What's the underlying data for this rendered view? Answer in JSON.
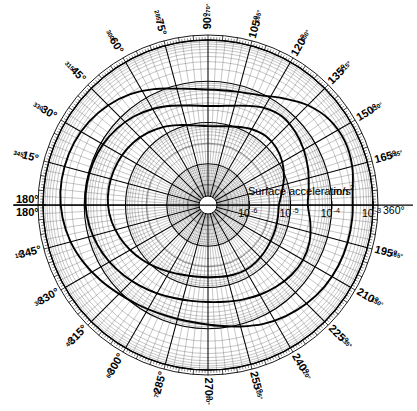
{
  "figure": {
    "kind": "polar-diagram",
    "axis_title": "Surface acceleration",
    "axis_units": "m/s",
    "axis_units_exponent": "2",
    "center_x": 208,
    "center_y": 205,
    "outer_radius": 165
  },
  "radial_axis": {
    "scale": "log10",
    "ticks": [
      {
        "label_base": "10",
        "label_exp": "-6",
        "radius": 41.25
      },
      {
        "label_base": "10",
        "label_exp": "-5",
        "radius": 82.5
      },
      {
        "label_base": "10",
        "label_exp": "-4",
        "radius": 123.75
      },
      {
        "label_base": "10",
        "label_exp": "-3",
        "radius": 165
      }
    ],
    "end_label": "360°"
  },
  "angular_labels": [
    {
      "angle_deg": 0,
      "inner": "180°",
      "outer": "180°",
      "style": "horizontal-left-stack"
    },
    {
      "angle_deg": 15,
      "inner": "165°",
      "outer": "345°"
    },
    {
      "angle_deg": 30,
      "inner": "150°",
      "outer": "330°"
    },
    {
      "angle_deg": 45,
      "inner": "135°",
      "outer": "315°"
    },
    {
      "angle_deg": 60,
      "inner": "120°",
      "outer": "300°"
    },
    {
      "angle_deg": 75,
      "inner": "105°",
      "outer": "285°"
    },
    {
      "angle_deg": 90,
      "inner": "90°",
      "outer": "270°"
    },
    {
      "angle_deg": 105,
      "inner": "75°",
      "outer": "285°"
    },
    {
      "angle_deg": 120,
      "inner": "60°",
      "outer": "300°"
    },
    {
      "angle_deg": 135,
      "inner": "45°",
      "outer": "315°"
    },
    {
      "angle_deg": 150,
      "inner": "30°",
      "outer": "330°"
    },
    {
      "angle_deg": 165,
      "inner": "15°",
      "outer": "345°"
    },
    {
      "angle_deg": 180,
      "inner": "360°",
      "outer": "360°",
      "style": "axis-end"
    },
    {
      "angle_deg": 195,
      "inner": "345°",
      "outer": "15°"
    },
    {
      "angle_deg": 210,
      "inner": "330°",
      "outer": "30°"
    },
    {
      "angle_deg": 225,
      "inner": "315°",
      "outer": "45°"
    },
    {
      "angle_deg": 240,
      "inner": "300°",
      "outer": "60°"
    },
    {
      "angle_deg": 255,
      "inner": "285°",
      "outer": "75°"
    },
    {
      "angle_deg": 270,
      "inner": "270°",
      "outer": "90°"
    },
    {
      "angle_deg": 285,
      "inner": "255°",
      "outer": "105°"
    },
    {
      "angle_deg": 300,
      "inner": "240°",
      "outer": "120°"
    },
    {
      "angle_deg": 315,
      "inner": "225°",
      "outer": "135°"
    },
    {
      "angle_deg": 330,
      "inner": "210°",
      "outer": "150°"
    },
    {
      "angle_deg": 345,
      "inner": "195°",
      "outer": "165°"
    }
  ],
  "chart_data": {
    "type": "line",
    "subtitle": "",
    "xlabel": "",
    "ylabel": "Surface acceleration m/s²",
    "coordinate_system": "polar",
    "radial_scale": "log10",
    "radial_tick_labels": [
      "10^-6",
      "10^-5",
      "10^-4",
      "10^-3"
    ],
    "radial_tick_radii_px": [
      41.25,
      82.5,
      123.75,
      165
    ],
    "angular_tick_labels": [
      "180°",
      "165°",
      "150°",
      "135°",
      "120°",
      "105°",
      "90°",
      "75°",
      "60°",
      "45°",
      "30°",
      "15°",
      "360°",
      "345°",
      "330°",
      "315°",
      "300°",
      "285°",
      "270°",
      "255°",
      "240°",
      "225°",
      "210°",
      "195°"
    ],
    "angular_tick_step_deg": 15,
    "grid": true,
    "legend": "none",
    "annotations": [
      "Surface acceleration m/s²",
      "360°",
      "180°"
    ],
    "series": [
      {
        "name": "outer contour",
        "closed": true,
        "points_polar": [
          {
            "theta": 0,
            "r": 0.605
          },
          {
            "theta": 10,
            "r": 0.62
          },
          {
            "theta": 20,
            "r": 0.645
          },
          {
            "theta": 30,
            "r": 0.67
          },
          {
            "theta": 40,
            "r": 0.69
          },
          {
            "theta": 50,
            "r": 0.7
          },
          {
            "theta": 60,
            "r": 0.68
          },
          {
            "theta": 70,
            "r": 0.64
          },
          {
            "theta": 80,
            "r": 0.61
          },
          {
            "theta": 90,
            "r": 0.6
          },
          {
            "theta": 100,
            "r": 0.612
          },
          {
            "theta": 110,
            "r": 0.64
          },
          {
            "theta": 120,
            "r": 0.672
          },
          {
            "theta": 130,
            "r": 0.7
          },
          {
            "theta": 140,
            "r": 0.72
          },
          {
            "theta": 150,
            "r": 0.735
          },
          {
            "theta": 160,
            "r": 0.742
          },
          {
            "theta": 170,
            "r": 0.745
          },
          {
            "theta": 180,
            "r": 0.742
          },
          {
            "theta": 190,
            "r": 0.73
          },
          {
            "theta": 200,
            "r": 0.712
          },
          {
            "theta": 210,
            "r": 0.69
          },
          {
            "theta": 220,
            "r": 0.665
          },
          {
            "theta": 230,
            "r": 0.64
          },
          {
            "theta": 240,
            "r": 0.618
          },
          {
            "theta": 250,
            "r": 0.6
          },
          {
            "theta": 260,
            "r": 0.59
          },
          {
            "theta": 270,
            "r": 0.588
          },
          {
            "theta": 280,
            "r": 0.595
          },
          {
            "theta": 290,
            "r": 0.61
          },
          {
            "theta": 300,
            "r": 0.628
          },
          {
            "theta": 310,
            "r": 0.645
          },
          {
            "theta": 320,
            "r": 0.66
          },
          {
            "theta": 330,
            "r": 0.665
          },
          {
            "theta": 340,
            "r": 0.655
          },
          {
            "theta": 350,
            "r": 0.63
          }
        ]
      },
      {
        "name": "inner contour",
        "closed": true,
        "points_polar": [
          {
            "theta": 0,
            "r": 0.43
          },
          {
            "theta": 10,
            "r": 0.455
          },
          {
            "theta": 20,
            "r": 0.49
          },
          {
            "theta": 30,
            "r": 0.52
          },
          {
            "theta": 40,
            "r": 0.54
          },
          {
            "theta": 50,
            "r": 0.545
          },
          {
            "theta": 60,
            "r": 0.53
          },
          {
            "theta": 70,
            "r": 0.505
          },
          {
            "theta": 80,
            "r": 0.485
          },
          {
            "theta": 90,
            "r": 0.478
          },
          {
            "theta": 100,
            "r": 0.49
          },
          {
            "theta": 110,
            "r": 0.515
          },
          {
            "theta": 120,
            "r": 0.545
          },
          {
            "theta": 130,
            "r": 0.57
          },
          {
            "theta": 140,
            "r": 0.59
          },
          {
            "theta": 150,
            "r": 0.602
          },
          {
            "theta": 160,
            "r": 0.608
          },
          {
            "theta": 170,
            "r": 0.61
          },
          {
            "theta": 180,
            "r": 0.606
          },
          {
            "theta": 190,
            "r": 0.592
          },
          {
            "theta": 200,
            "r": 0.57
          },
          {
            "theta": 210,
            "r": 0.545
          },
          {
            "theta": 220,
            "r": 0.518
          },
          {
            "theta": 230,
            "r": 0.492
          },
          {
            "theta": 240,
            "r": 0.468
          },
          {
            "theta": 250,
            "r": 0.45
          },
          {
            "theta": 260,
            "r": 0.44
          },
          {
            "theta": 270,
            "r": 0.438
          },
          {
            "theta": 280,
            "r": 0.442
          },
          {
            "theta": 290,
            "r": 0.45
          },
          {
            "theta": 300,
            "r": 0.455
          },
          {
            "theta": 310,
            "r": 0.452
          },
          {
            "theta": 320,
            "r": 0.445
          },
          {
            "theta": 330,
            "r": 0.438
          },
          {
            "theta": 340,
            "r": 0.434
          },
          {
            "theta": 350,
            "r": 0.43
          }
        ]
      },
      {
        "name": "diagonal lobe contour",
        "closed": true,
        "points_polar": [
          {
            "theta": 5,
            "r": 0.88
          },
          {
            "theta": 15,
            "r": 0.905
          },
          {
            "theta": 25,
            "r": 0.915
          },
          {
            "theta": 35,
            "r": 0.9
          },
          {
            "theta": 45,
            "r": 0.855
          },
          {
            "theta": 55,
            "r": 0.79
          },
          {
            "theta": 65,
            "r": 0.735
          },
          {
            "theta": 75,
            "r": 0.71
          },
          {
            "theta": 85,
            "r": 0.7
          },
          {
            "theta": 95,
            "r": 0.705
          },
          {
            "theta": 105,
            "r": 0.73
          },
          {
            "theta": 115,
            "r": 0.775
          },
          {
            "theta": 125,
            "r": 0.82
          },
          {
            "theta": 135,
            "r": 0.855
          },
          {
            "theta": 145,
            "r": 0.88
          },
          {
            "theta": 155,
            "r": 0.895
          },
          {
            "theta": 165,
            "r": 0.9
          },
          {
            "theta": 175,
            "r": 0.898
          },
          {
            "theta": 185,
            "r": 0.885
          },
          {
            "theta": 195,
            "r": 0.862
          },
          {
            "theta": 205,
            "r": 0.83
          },
          {
            "theta": 215,
            "r": 0.795
          },
          {
            "theta": 225,
            "r": 0.762
          },
          {
            "theta": 235,
            "r": 0.738
          },
          {
            "theta": 245,
            "r": 0.722
          },
          {
            "theta": 255,
            "r": 0.715
          },
          {
            "theta": 265,
            "r": 0.718
          },
          {
            "theta": 275,
            "r": 0.735
          },
          {
            "theta": 285,
            "r": 0.762
          },
          {
            "theta": 295,
            "r": 0.795
          },
          {
            "theta": 305,
            "r": 0.822
          },
          {
            "theta": 315,
            "r": 0.845
          },
          {
            "theta": 325,
            "r": 0.862
          },
          {
            "theta": 335,
            "r": 0.872
          },
          {
            "theta": 345,
            "r": 0.876
          },
          {
            "theta": 355,
            "r": 0.878
          }
        ]
      }
    ]
  }
}
